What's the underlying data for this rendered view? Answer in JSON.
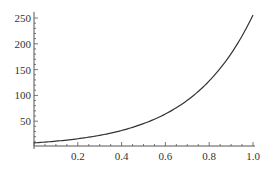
{
  "chart_data": {
    "type": "line",
    "title": "",
    "xlabel": "",
    "ylabel": "",
    "xlim": [
      0,
      1.0
    ],
    "ylim": [
      0,
      256
    ],
    "grid": false,
    "legend": null,
    "x_ticks": [
      0.2,
      0.4,
      0.6,
      0.8,
      1.0
    ],
    "x_tick_labels": [
      "0.2",
      "0.4",
      "0.6",
      "0.8",
      "1.0"
    ],
    "y_ticks": [
      50,
      100,
      150,
      200,
      250
    ],
    "y_tick_labels": [
      "50",
      "100",
      "150",
      "200",
      "250"
    ],
    "series": [
      {
        "name": "f(x)",
        "color": "#333333",
        "x": [
          0.0,
          0.1,
          0.2,
          0.3,
          0.4,
          0.5,
          0.6,
          0.7,
          0.8,
          0.9,
          1.0
        ],
        "values": [
          8,
          11.3,
          16,
          22.6,
          32,
          45.3,
          64,
          90.5,
          128,
          181,
          256
        ]
      }
    ]
  },
  "plot": {
    "x0_px": 34,
    "x1_px": 253,
    "y0_px": 147,
    "y_scale": 0.516,
    "axis_y_px": 146,
    "axis_color": "#555555",
    "line_color": "#333333"
  }
}
